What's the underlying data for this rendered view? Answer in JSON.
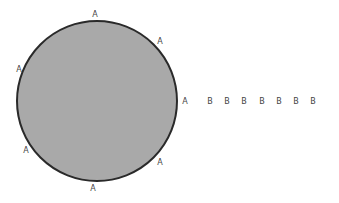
{
  "diagram": {
    "circle": {
      "cx": 97,
      "cy": 101,
      "r": 80,
      "fill": "#a9a9a9",
      "stroke": "#2a2a2a"
    },
    "a_labels": [
      {
        "text": "A",
        "x": 95,
        "y": 17
      },
      {
        "text": "A",
        "x": 160,
        "y": 44
      },
      {
        "text": "A",
        "x": 185,
        "y": 104
      },
      {
        "text": "A",
        "x": 160,
        "y": 165
      },
      {
        "text": "A",
        "x": 93,
        "y": 191
      },
      {
        "text": "A",
        "x": 26,
        "y": 153
      },
      {
        "text": "A",
        "x": 19,
        "y": 72
      }
    ],
    "b_labels": [
      {
        "text": "B",
        "x": 210,
        "y": 104
      },
      {
        "text": "B",
        "x": 227,
        "y": 104
      },
      {
        "text": "B",
        "x": 244,
        "y": 104
      },
      {
        "text": "B",
        "x": 262,
        "y": 104
      },
      {
        "text": "B",
        "x": 279,
        "y": 104
      },
      {
        "text": "B",
        "x": 296,
        "y": 104
      },
      {
        "text": "B",
        "x": 313,
        "y": 104
      }
    ]
  }
}
